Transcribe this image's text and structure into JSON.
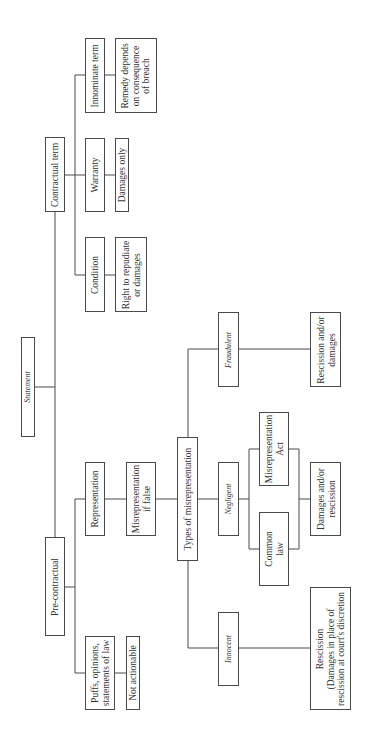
{
  "diagram": {
    "orientation": "rotated 90deg counter-clockwise (text reads bottom-to-top)",
    "root": {
      "label": "Statement",
      "italic": true
    },
    "branches": {
      "contractual": {
        "label": "Contractual term",
        "children": [
          {
            "label": "Condition",
            "outcome": "Right to repudiate\nor damages"
          },
          {
            "label": "Warranty",
            "outcome": "Damages only"
          },
          {
            "label": "Innominate term",
            "outcome": "Remedy depends\non consequence\nof breach"
          }
        ]
      },
      "pre_contractual": {
        "label": "Pre-contractual",
        "children": [
          {
            "label": "Puffs, opinions,\nstatements of law",
            "outcome": "Not actionable"
          },
          {
            "label": "Representation",
            "outcome": "Misrepresentation\nif false"
          }
        ]
      }
    },
    "types": {
      "label": "Types of misrepresentation",
      "fraudulent": {
        "label": "Fraudulent",
        "outcome": "Rescission and/or\ndamages"
      },
      "negligent": {
        "label": "Negligent",
        "sources": [
          "Misrepresentation\nAct",
          "Common\nlaw"
        ],
        "outcome": "Damages and/or\nrescission"
      },
      "innocent": {
        "label": "Innocent",
        "outcome": "Rescission\n(Damages in place of\nrescission at court's discretion"
      }
    }
  },
  "colors": {
    "line": "#4a4a4a",
    "text": "#333333",
    "background": "#ffffff"
  }
}
